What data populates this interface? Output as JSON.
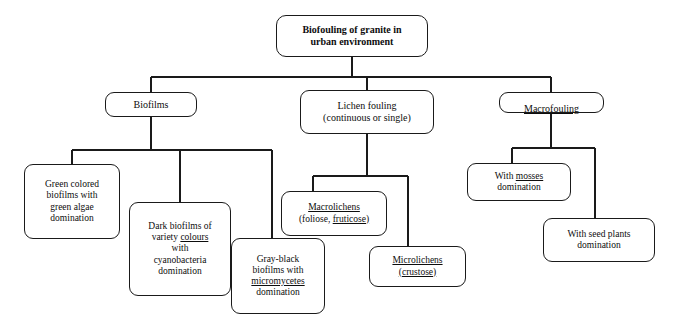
{
  "diagram": {
    "title_node": {
      "id": "root",
      "label": "Biofouling of granite in\nurban environment"
    },
    "level2": [
      {
        "id": "biofilms",
        "label": "Biofilms"
      },
      {
        "id": "lichen-fouling",
        "label": "Lichen fouling\n(continuous or single)"
      },
      {
        "id": "macrofouling",
        "label": "Macrofouling",
        "underlined": true
      }
    ],
    "leaves": [
      {
        "id": "green-biofilms",
        "parent": "biofilms",
        "lines": [
          "Green colored",
          "biofilms with",
          "green algae",
          "domination"
        ],
        "underlined_words": []
      },
      {
        "id": "dark-biofilms",
        "parent": "biofilms",
        "lines": [
          "Dark biofilms of",
          "variety colours",
          "with",
          "cyanobacteria",
          "domination"
        ],
        "underlined_words": [
          "colours"
        ]
      },
      {
        "id": "gray-black-biofilms",
        "parent": "biofilms",
        "lines": [
          "Gray-black",
          "biofilms with",
          "micromycetes",
          "domination"
        ],
        "underlined_words": [
          "micromycetes"
        ]
      },
      {
        "id": "macrolichens",
        "parent": "lichen-fouling",
        "lines": [
          "Macrolichens",
          "(foliose, fruticose)"
        ],
        "underlined_words": [
          "Macrolichens",
          "fruticose"
        ]
      },
      {
        "id": "microlichens",
        "parent": "lichen-fouling",
        "lines": [
          "Microlichens",
          "(crustose)"
        ],
        "underlined_words": [
          "Microlichens",
          "crustose"
        ]
      },
      {
        "id": "mosses",
        "parent": "macrofouling",
        "lines": [
          "With mosses",
          "domination"
        ],
        "underlined_words": [
          "mosses"
        ]
      },
      {
        "id": "seed-plants",
        "parent": "macrofouling",
        "lines": [
          "With seed plants",
          "domination"
        ],
        "underlined_words": []
      }
    ],
    "colors": {
      "stroke": "#1a1a1a",
      "text": "#0d0d0d",
      "background": "#ffffff"
    }
  }
}
